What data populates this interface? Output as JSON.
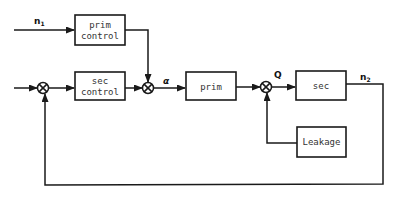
{
  "diagram": {
    "type": "control-block-diagram",
    "signals": {
      "n1": "n",
      "n1_sub": "1",
      "alpha": "α",
      "Q": "Q",
      "n2": "n",
      "n2_sub": "2"
    },
    "blocks": {
      "prim_control": {
        "line1": "prim",
        "line2": "control"
      },
      "sec_control": {
        "line1": "sec",
        "line2": "control"
      },
      "prim": {
        "label": "prim"
      },
      "sec": {
        "label": "sec"
      },
      "leakage": {
        "label": "Leakage"
      }
    },
    "summing_junctions": [
      "sum-input",
      "sum-alpha",
      "sum-Q"
    ],
    "connections": [
      [
        "n1",
        "prim_control"
      ],
      [
        "input",
        "sum-input"
      ],
      [
        "sum-input",
        "sec_control"
      ],
      [
        "sec_control",
        "sum-alpha"
      ],
      [
        "prim_control",
        "sum-alpha"
      ],
      [
        "sum-alpha",
        "prim"
      ],
      [
        "prim",
        "sum-Q"
      ],
      [
        "leakage",
        "sum-Q"
      ],
      [
        "sum-Q",
        "sec"
      ],
      [
        "sec",
        "n2"
      ],
      [
        "n2",
        "sum-input (feedback)"
      ]
    ],
    "colors": {
      "line": "#1a1a1a",
      "background": "#ffffff"
    }
  }
}
